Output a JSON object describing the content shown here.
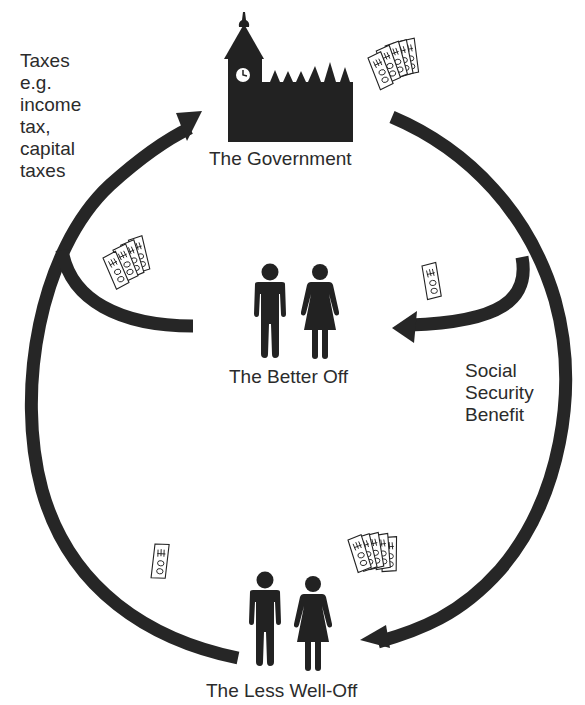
{
  "diagram": {
    "type": "flow-cycle",
    "nodes": [
      {
        "id": "government",
        "label": "The Government",
        "icon": "parliament-building-icon"
      },
      {
        "id": "better_off",
        "label": "The Better Off",
        "icon": "man-woman-icon"
      },
      {
        "id": "less_well_off",
        "label": "The Less Well-Off",
        "icon": "man-woman-icon"
      }
    ],
    "edges": [
      {
        "from": "better_off",
        "to": "government",
        "label": "Taxes e.g. income tax, capital taxes",
        "money_icon": "bundle-of-banknotes-icon"
      },
      {
        "from": "less_well_off",
        "to": "government",
        "label": "Taxes e.g. income tax, capital taxes",
        "money_icon": "single-banknote-icon"
      },
      {
        "from": "government",
        "to": "better_off",
        "label": "Social Security Benefit",
        "money_icon": "single-banknote-icon"
      },
      {
        "from": "government",
        "to": "less_well_off",
        "label": "Social Security Benefit",
        "money_icon": "bundle-of-banknotes-icon"
      }
    ]
  },
  "labels": {
    "taxes": {
      "lines": [
        "Taxes",
        "e.g.",
        "income",
        "tax,",
        "capital",
        "taxes"
      ]
    },
    "social_security": {
      "lines": [
        "Social",
        "Security",
        "Benefit"
      ]
    },
    "government": "The Government",
    "better_off": "The Better Off",
    "less_well_off": "The Less Well-Off"
  },
  "colors": {
    "ink": "#262626",
    "background": "#ffffff"
  }
}
